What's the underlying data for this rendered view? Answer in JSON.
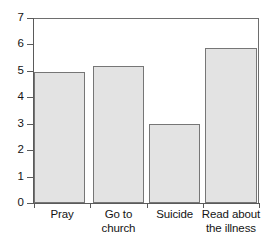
{
  "chart_data": {
    "type": "bar",
    "title": "",
    "subtitle": "",
    "xlabel": "",
    "ylabel": "",
    "categories": [
      "Pray",
      "Go to church",
      "Suicide",
      "Read about the illness"
    ],
    "category_lines": [
      [
        "Pray"
      ],
      [
        "Go to",
        "church"
      ],
      [
        "Suicide"
      ],
      [
        "Read about",
        "the illness"
      ]
    ],
    "values": [
      4.95,
      5.2,
      3.0,
      5.85
    ],
    "ylim": [
      0,
      7
    ],
    "ytick_labels": [
      "0",
      "1",
      "2",
      "3",
      "4",
      "5",
      "6",
      "7"
    ],
    "ytick_values": [
      0,
      1,
      2,
      3,
      4,
      5,
      6,
      7
    ],
    "grid": false,
    "legend": "none",
    "bar_fill_color": "#e3e3e3",
    "bar_border_color": "#767676",
    "axis_color": "#5a5a5a",
    "background_color": "#ffffff"
  }
}
